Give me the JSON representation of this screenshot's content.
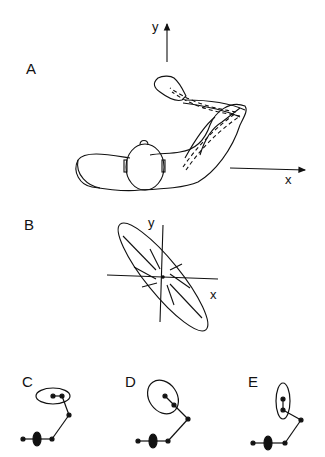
{
  "panels": {
    "A": {
      "label": "A",
      "x_axis": "x",
      "y_axis": "y",
      "description": "Top view of subject with arm extended, shoulder and elbow joints"
    },
    "B": {
      "label": "B",
      "x_axis": "x",
      "y_axis": "y",
      "description": "Elongated ellipse oriented diagonally with radial lines through center"
    },
    "C": {
      "label": "C",
      "description": "Arm configuration with horizontal ellipse at endpoint"
    },
    "D": {
      "label": "D",
      "description": "Arm configuration with tilted ellipse at endpoint"
    },
    "E": {
      "label": "E",
      "description": "Arm configuration with vertical ellipse at endpoint"
    }
  },
  "colors": {
    "stroke": "#111111",
    "background": "#ffffff"
  }
}
